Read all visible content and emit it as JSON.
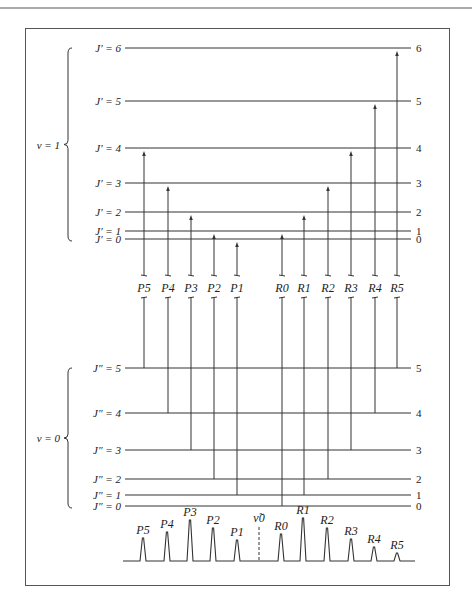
{
  "figure": {
    "colors": {
      "line": "#333333",
      "frame": "#555555",
      "text": "#222222"
    },
    "upper_state": {
      "label": "v = 1",
      "levels": [
        {
          "j": 0,
          "label": "J′ = 0",
          "right": "0",
          "y": 239
        },
        {
          "j": 1,
          "label": "J′ = 1",
          "right": "1",
          "y": 231
        },
        {
          "j": 2,
          "label": "J′ = 2",
          "right": "2",
          "y": 212
        },
        {
          "j": 3,
          "label": "J′ = 3",
          "right": "3",
          "y": 183
        },
        {
          "j": 4,
          "label": "J′ = 4",
          "right": "4",
          "y": 148
        },
        {
          "j": 5,
          "label": "J′ = 5",
          "right": "5",
          "y": 101
        },
        {
          "j": 6,
          "label": "J′ = 6",
          "right": "6",
          "y": 48
        }
      ]
    },
    "lower_state": {
      "label": "v = 0",
      "levels": [
        {
          "j": 0,
          "label": "J″ = 0",
          "right": "0",
          "y": 506
        },
        {
          "j": 1,
          "label": "J″ = 1",
          "right": "1",
          "y": 495
        },
        {
          "j": 2,
          "label": "J″ = 2",
          "right": "2",
          "y": 479
        },
        {
          "j": 3,
          "label": "J″ = 3",
          "right": "3",
          "y": 450
        },
        {
          "j": 4,
          "label": "J″ = 4",
          "right": "4",
          "y": 413
        },
        {
          "j": 5,
          "label": "J″ = 5",
          "right": "5",
          "y": 368
        }
      ]
    },
    "transitions": [
      {
        "label": "P5",
        "x": 144,
        "lower_j": 5,
        "upper_j": 4
      },
      {
        "label": "P4",
        "x": 168,
        "lower_j": 4,
        "upper_j": 3
      },
      {
        "label": "P3",
        "x": 191,
        "lower_j": 3,
        "upper_j": 2
      },
      {
        "label": "P2",
        "x": 214,
        "lower_j": 2,
        "upper_j": 1
      },
      {
        "label": "P1",
        "x": 237,
        "lower_j": 1,
        "upper_j": 0
      },
      {
        "label": "R0",
        "x": 282,
        "lower_j": 0,
        "upper_j": 1
      },
      {
        "label": "R1",
        "x": 304,
        "lower_j": 1,
        "upper_j": 2
      },
      {
        "label": "R2",
        "x": 328,
        "lower_j": 2,
        "upper_j": 3
      },
      {
        "label": "R3",
        "x": 351,
        "lower_j": 3,
        "upper_j": 4
      },
      {
        "label": "R4",
        "x": 375,
        "lower_j": 4,
        "upper_j": 5
      },
      {
        "label": "R5",
        "x": 397,
        "lower_j": 5,
        "upper_j": 6
      }
    ],
    "spectrum": {
      "origin_label": "ν̃0",
      "origin_x": 259,
      "baseline_y": 561,
      "peaks": [
        {
          "label": "P5",
          "x": 143,
          "top": 538
        },
        {
          "label": "P4",
          "x": 167,
          "top": 532
        },
        {
          "label": "P3",
          "x": 190,
          "top": 520
        },
        {
          "label": "P2",
          "x": 213,
          "top": 528
        },
        {
          "label": "P1",
          "x": 237,
          "top": 540
        },
        {
          "label": "R0",
          "x": 281,
          "top": 534
        },
        {
          "label": "R1",
          "x": 303,
          "top": 518
        },
        {
          "label": "R2",
          "x": 327,
          "top": 528
        },
        {
          "label": "R3",
          "x": 351,
          "top": 539
        },
        {
          "label": "R4",
          "x": 374,
          "top": 547
        },
        {
          "label": "R5",
          "x": 397,
          "top": 553
        }
      ]
    }
  }
}
